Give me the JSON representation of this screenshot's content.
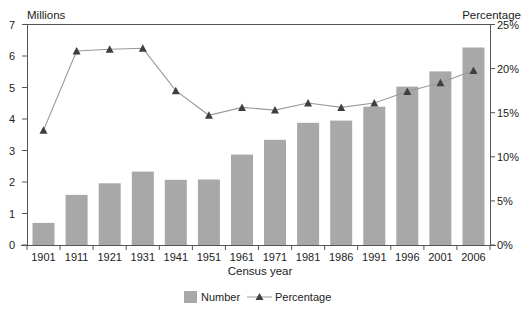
{
  "chart_data": {
    "type": "bar+line",
    "title": "",
    "xlabel": "Census year",
    "ylabel_left": "Millions",
    "ylabel_right": "Percentage",
    "categories": [
      "1901",
      "1911",
      "1921",
      "1931",
      "1941",
      "1951",
      "1961",
      "1971",
      "1981",
      "1986",
      "1991",
      "1996",
      "2001",
      "2006"
    ],
    "series": [
      {
        "name": "Number",
        "type": "bar",
        "axis": "left",
        "color": "#a8a8a8",
        "values": [
          0.7,
          1.59,
          1.96,
          2.33,
          2.07,
          2.08,
          2.87,
          3.34,
          3.88,
          3.95,
          4.39,
          5.03,
          5.51,
          6.27
        ]
      },
      {
        "name": "Percentage",
        "type": "line",
        "axis": "right",
        "marker": "triangle",
        "line_color": "#9a9a9a",
        "marker_color": "#3f3f3f",
        "values": [
          13.0,
          22.0,
          22.2,
          22.3,
          17.5,
          14.7,
          15.6,
          15.3,
          16.1,
          15.6,
          16.1,
          17.4,
          18.4,
          19.8
        ]
      }
    ],
    "ylim_left": [
      0,
      7
    ],
    "yticks_left": [
      "0",
      "1",
      "2",
      "3",
      "4",
      "5",
      "6",
      "7"
    ],
    "ylim_right": [
      0,
      25
    ],
    "yticks_right": [
      "0%",
      "5%",
      "10%",
      "15%",
      "20%",
      "25%"
    ],
    "grid": false,
    "legend_position": "bottom-center"
  },
  "legend": {
    "number_label": "Number",
    "percentage_label": "Percentage"
  }
}
